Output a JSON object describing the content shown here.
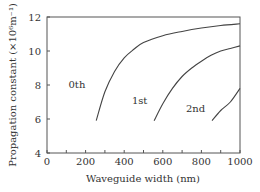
{
  "chart_data": {
    "type": "line",
    "title": "",
    "xlabel": "Waveguide width (nm)",
    "ylabel": "Propagation constant (×10⁶m⁻¹)",
    "xlim": [
      0,
      1000
    ],
    "ylim": [
      4,
      12
    ],
    "xticks": [
      0,
      200,
      400,
      600,
      800,
      1000
    ],
    "yticks": [
      4,
      6,
      8,
      10,
      12
    ],
    "grid": false,
    "legend": "none (inline curve labels)",
    "series": [
      {
        "name": "0th",
        "x": [
          255,
          300,
          350,
          400,
          450,
          500,
          600,
          700,
          800,
          900,
          1000
        ],
        "y": [
          5.9,
          7.6,
          8.8,
          9.6,
          10.1,
          10.5,
          10.9,
          11.15,
          11.35,
          11.5,
          11.6
        ]
      },
      {
        "name": "1st",
        "x": [
          555,
          600,
          650,
          700,
          750,
          800,
          850,
          900,
          950,
          1000
        ],
        "y": [
          5.9,
          6.9,
          7.8,
          8.5,
          9.0,
          9.4,
          9.75,
          10.0,
          10.15,
          10.3
        ]
      },
      {
        "name": "2nd",
        "x": [
          855,
          900,
          950,
          1000
        ],
        "y": [
          5.9,
          6.5,
          7.0,
          7.8
        ]
      }
    ],
    "annotations": [
      {
        "text": "0th",
        "x": 155,
        "y": 7.8
      },
      {
        "text": "1st",
        "x": 480,
        "y": 6.9
      },
      {
        "text": "2nd",
        "x": 770,
        "y": 6.4
      }
    ]
  }
}
